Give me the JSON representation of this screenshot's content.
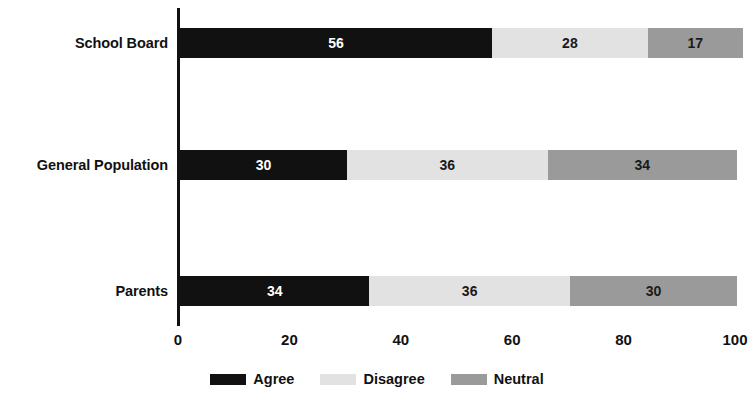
{
  "chart_data": {
    "type": "bar",
    "orientation": "horizontal",
    "stacked": true,
    "title": "",
    "subtitle": "",
    "xlabel": "",
    "ylabel": "",
    "xlim": [
      0,
      100
    ],
    "xticks": [
      "0",
      "20",
      "40",
      "60",
      "80",
      "100"
    ],
    "grid": false,
    "legend_position": "bottom-center",
    "categories": [
      "School Board",
      "General Population",
      "Parents"
    ],
    "series": [
      {
        "name": "Agree",
        "color": "#111111",
        "values": [
          56,
          30,
          34
        ]
      },
      {
        "name": "Disagree",
        "color": "#e2e2e2",
        "values": [
          28,
          36,
          36
        ]
      },
      {
        "name": "Neutral",
        "color": "#9a9a9a",
        "values": [
          17,
          34,
          30
        ]
      }
    ],
    "rows": [
      {
        "category": "School Board",
        "segments": [
          {
            "series": "Agree",
            "value": 56,
            "label": "56",
            "start": 0,
            "color": "#111111"
          },
          {
            "series": "Disagree",
            "value": 28,
            "label": "28",
            "start": 56,
            "color": "#e2e2e2"
          },
          {
            "series": "Neutral",
            "value": 17,
            "label": "17",
            "start": 84,
            "color": "#9a9a9a"
          }
        ]
      },
      {
        "category": "General Population",
        "segments": [
          {
            "series": "Agree",
            "value": 30,
            "label": "30",
            "start": 0,
            "color": "#111111"
          },
          {
            "series": "Disagree",
            "value": 36,
            "label": "36",
            "start": 30,
            "color": "#e2e2e2"
          },
          {
            "series": "Neutral",
            "value": 34,
            "label": "34",
            "start": 66,
            "color": "#9a9a9a"
          }
        ]
      },
      {
        "category": "Parents",
        "segments": [
          {
            "series": "Agree",
            "value": 34,
            "label": "34",
            "start": 0,
            "color": "#111111"
          },
          {
            "series": "Disagree",
            "value": 36,
            "label": "36",
            "start": 34,
            "color": "#e2e2e2"
          },
          {
            "series": "Neutral",
            "value": 30,
            "label": "30",
            "start": 70,
            "color": "#9a9a9a"
          }
        ]
      }
    ],
    "legend": [
      {
        "label": "Agree",
        "color": "#111111"
      },
      {
        "label": "Disagree",
        "color": "#e2e2e2"
      },
      {
        "label": "Neutral",
        "color": "#9a9a9a"
      }
    ]
  }
}
